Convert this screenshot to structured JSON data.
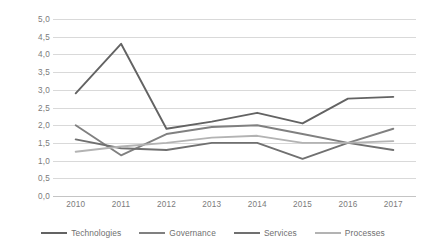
{
  "chart_data": {
    "type": "line",
    "title": "",
    "subtitle": "",
    "xlabel": "",
    "ylabel": "",
    "categories": [
      "2010",
      "2011",
      "2012",
      "2013",
      "2014",
      "2015",
      "2016",
      "2017"
    ],
    "x": [
      2010,
      2011,
      2012,
      2013,
      2014,
      2015,
      2016,
      2017
    ],
    "ylim": [
      0.0,
      5.0
    ],
    "ytick_step": 0.5,
    "ytick_labels": [
      "0,0",
      "0,5",
      "1,0",
      "1,5",
      "2,0",
      "2,5",
      "3,0",
      "3,5",
      "4,0",
      "4,5",
      "5,0"
    ],
    "ytick_values": [
      0.0,
      0.5,
      1.0,
      1.5,
      2.0,
      2.5,
      3.0,
      3.5,
      4.0,
      4.5,
      5.0
    ],
    "grid": true,
    "grid_axis": "y",
    "decimal_separator": ",",
    "legend_position": "bottom",
    "series": [
      {
        "name": "Technologies",
        "color": "#636363",
        "values": [
          2.9,
          4.3,
          1.9,
          2.1,
          2.35,
          2.05,
          2.75,
          2.8
        ]
      },
      {
        "name": "Governance",
        "color": "#808080",
        "values": [
          2.0,
          1.15,
          1.75,
          1.95,
          2.0,
          1.75,
          1.5,
          1.9
        ]
      },
      {
        "name": "Services",
        "color": "#707070",
        "values": [
          1.6,
          1.35,
          1.3,
          1.5,
          1.5,
          1.05,
          1.5,
          1.3
        ]
      },
      {
        "name": "Processes",
        "color": "#b3b3b3",
        "values": [
          1.25,
          1.4,
          1.5,
          1.65,
          1.7,
          1.5,
          1.5,
          1.55
        ]
      }
    ]
  },
  "legend": {
    "items": [
      {
        "label": "Technologies",
        "color": "#636363"
      },
      {
        "label": "Governance",
        "color": "#808080"
      },
      {
        "label": "Services",
        "color": "#707070"
      },
      {
        "label": "Processes",
        "color": "#b3b3b3"
      }
    ]
  },
  "colors": {
    "background": "#ffffff",
    "gridline": "#d9d9d9",
    "axis_text": "#7b7b7b",
    "legend_text": "#6f6f6f"
  }
}
